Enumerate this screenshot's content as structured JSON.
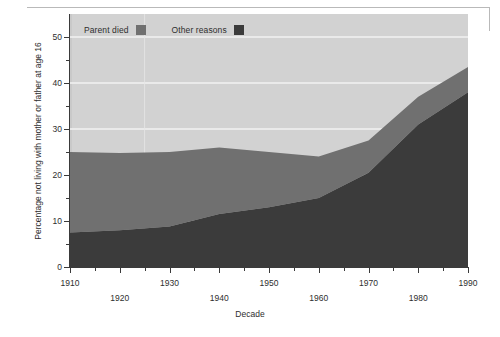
{
  "chart_data": {
    "type": "area",
    "title": "",
    "subtitle": "",
    "xlabel": "Decade",
    "ylabel": "Percentage not living with mother or father at age 16",
    "stacked": true,
    "grid": true,
    "legend_position": "top-left",
    "x": [
      1910,
      1920,
      1930,
      1940,
      1950,
      1960,
      1970,
      1980,
      1990
    ],
    "categories": [
      "1910",
      "1920",
      "1930",
      "1940",
      "1950",
      "1960",
      "1970",
      "1980",
      "1990"
    ],
    "xlim": [
      1910,
      1990
    ],
    "ylim": [
      0,
      55
    ],
    "yticks": [
      0,
      10,
      20,
      30,
      40,
      50
    ],
    "ytick_labels": [
      "0",
      "10",
      "20",
      "30",
      "40",
      "50"
    ],
    "yminor_ticks": [
      5,
      15,
      25,
      35,
      45
    ],
    "xticks": [
      1910,
      1920,
      1930,
      1940,
      1950,
      1960,
      1970,
      1980,
      1990
    ],
    "xtick_labels": [
      "1910",
      "1920",
      "1930",
      "1940",
      "1950",
      "1960",
      "1970",
      "1980",
      "1990"
    ],
    "xminor_ticks": [
      1915,
      1925,
      1935,
      1945,
      1955,
      1965,
      1975,
      1985
    ],
    "series": [
      {
        "name": "Other reasons",
        "color": "#3b3b3b",
        "values": [
          7.5,
          8.0,
          8.8,
          11.5,
          13.0,
          15.0,
          20.5,
          31.0,
          38.0
        ]
      },
      {
        "name": "Parent died",
        "color": "#707070",
        "values": [
          17.5,
          16.8,
          16.2,
          14.5,
          12.0,
          9.0,
          7.0,
          6.0,
          5.5
        ]
      }
    ],
    "totals": [
      25.0,
      24.8,
      25.0,
      26.0,
      25.0,
      24.0,
      27.5,
      37.0,
      43.5
    ],
    "plot_background": "#d2d2d2",
    "gridline_color": "#f2f2f2",
    "axis_color": "#3a3a3a"
  },
  "legend": {
    "items": [
      {
        "label": "Parent died",
        "color": "#707070"
      },
      {
        "label": "Other reasons",
        "color": "#3b3b3b"
      }
    ]
  },
  "axes": {
    "x_title": "Decade",
    "y_title": "Percentage not living with mother or father at age 16"
  }
}
